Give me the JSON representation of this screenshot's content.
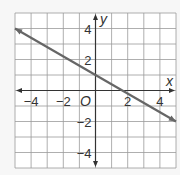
{
  "chart_data": {
    "type": "line",
    "title": "",
    "xlabel": "x",
    "ylabel": "y",
    "origin_label": "O",
    "xlim": [
      -5,
      5
    ],
    "ylim": [
      -5,
      5
    ],
    "grid": true,
    "grid_step": 1,
    "x_ticks": [
      {
        "value": -4,
        "label": "−4"
      },
      {
        "value": -2,
        "label": "−2"
      },
      {
        "value": 2,
        "label": "2"
      },
      {
        "value": 4,
        "label": "4"
      }
    ],
    "y_ticks": [
      {
        "value": 4,
        "label": "4"
      },
      {
        "value": 2,
        "label": "2"
      },
      {
        "value": -2,
        "label": "−2"
      },
      {
        "value": -4,
        "label": "−4"
      }
    ],
    "series": [
      {
        "name": "line",
        "equation": "y = -3/5 x + 1",
        "x": [
          -5,
          0,
          1.67,
          5
        ],
        "y": [
          4,
          1,
          0,
          -2
        ],
        "arrows": "both",
        "color": "#666666"
      }
    ]
  },
  "colors": {
    "background": "#f7f7f7",
    "plot_background": "#ffffff",
    "grid": "#9a9a9a",
    "axis": "#333333",
    "line": "#666666"
  }
}
